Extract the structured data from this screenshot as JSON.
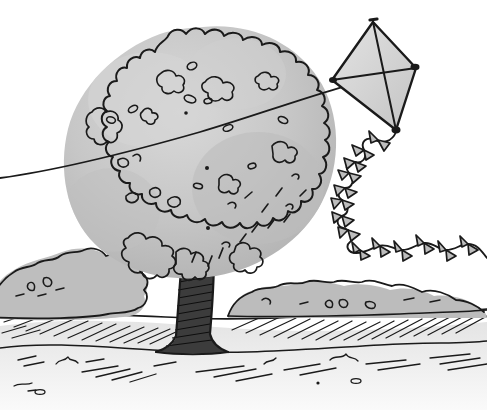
{
  "artwork": {
    "title": "Kite and Tree Line Drawing",
    "medium": "pen-and-ink sketch with gray wash",
    "background_color": "#ffffff",
    "ink_color": "#1a1a1a",
    "canvas": {
      "width": 487,
      "height": 410
    }
  },
  "palette": {
    "ink": "#1a1a1a",
    "foliage_fill": "#c6c6c6",
    "foliage_shadow": "#b0b0b0",
    "foliage_highlight": "#d8d8d8",
    "trunk_fill": "#3a3a3a",
    "kite_fill": "#e2e2e2",
    "kite_shadow": "#cfcfcf",
    "bush_fill": "#bdbdbd",
    "ground_wash": "#ededed"
  },
  "elements": {
    "kite": {
      "name": "kite",
      "shape": "diamond",
      "fill": "#e2e2e2",
      "apex": {
        "x": 373,
        "y": 22
      },
      "left_vertex": {
        "x": 332,
        "y": 80
      },
      "right_vertex": {
        "x": 416,
        "y": 68
      },
      "bottom_vertex": {
        "x": 396,
        "y": 130
      },
      "spars": 2
    },
    "kite_string": {
      "name": "kite-string",
      "description": "taut line running from lower-left edge up across the tree crown to the kite",
      "start": {
        "x": 0,
        "y": 178
      },
      "end": {
        "x": 416,
        "y": 68
      }
    },
    "kite_tail": {
      "name": "kite-tail",
      "description": "wavy tail hanging from the kite with bow-tie ribbons, curving down then right off frame",
      "ribbon_count": 18,
      "start": {
        "x": 396,
        "y": 132
      },
      "end": {
        "x": 487,
        "y": 262
      }
    },
    "tree": {
      "name": "tree",
      "canopy": {
        "shape": "scalloped round cloud",
        "center": {
          "x": 203,
          "y": 155
        },
        "radius_x": 136,
        "radius_y": 128,
        "fill": "#c6c6c6"
      },
      "trunk": {
        "fill": "#3a3a3a",
        "top": {
          "x": 198,
          "y": 262
        },
        "base": {
          "x": 198,
          "y": 350
        },
        "width": 36,
        "hatched": true
      },
      "leaf_marks": 22
    },
    "bush_left": {
      "name": "bush-left",
      "fill": "#bdbdbd",
      "bounds": {
        "x": -12,
        "y": 248,
        "width": 150,
        "height": 72
      }
    },
    "bush_right": {
      "name": "bush-right",
      "fill": "#bdbdbd",
      "bounds": {
        "x": 228,
        "y": 282,
        "width": 262,
        "height": 48
      }
    },
    "ground": {
      "name": "ground",
      "description": "hatched grassy field with horizon strokes and a pale foreground wash",
      "horizon_y": 316,
      "hatch_rows": 5
    }
  }
}
